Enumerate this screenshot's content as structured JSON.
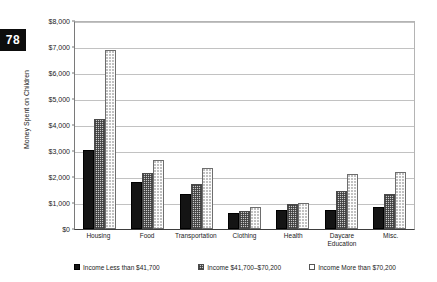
{
  "page_badge": {
    "number": "78"
  },
  "chart_data": {
    "type": "bar",
    "title": "",
    "xlabel": "",
    "ylabel": "Money Spent on Children",
    "ylim": [
      0,
      8000
    ],
    "ytick_labels": [
      "$8,000",
      "$7,000",
      "$6,000",
      "$5,000",
      "$4,000",
      "$3,000",
      "$2,000",
      "$1,000",
      "$0"
    ],
    "ytick_values": [
      8000,
      7000,
      6000,
      5000,
      4000,
      3000,
      2000,
      1000,
      0
    ],
    "grid": true,
    "legend_position": "bottom",
    "categories": [
      "Housing",
      "Food",
      "Transportation",
      "Clothing",
      "Health",
      "Daycare Education",
      "Misc."
    ],
    "category_label_lines": [
      [
        "Housing"
      ],
      [
        "Food"
      ],
      [
        "Transportation"
      ],
      [
        "Clothing"
      ],
      [
        "Health"
      ],
      [
        "Daycare",
        "Education"
      ],
      [
        "Misc."
      ]
    ],
    "series": [
      {
        "name": "Income Less than $41,700",
        "values": [
          3050,
          1800,
          1350,
          600,
          750,
          750,
          850
        ]
      },
      {
        "name": "Income $41,700–$70,200",
        "values": [
          4250,
          2150,
          1750,
          700,
          950,
          1450,
          1350
        ]
      },
      {
        "name": "Income More than $70,200",
        "values": [
          6880,
          2650,
          2350,
          850,
          1000,
          2100,
          2200
        ]
      }
    ]
  },
  "legend": {
    "items": [
      {
        "label": "Income Less than $41,700"
      },
      {
        "label": "Income $41,700–$70,200"
      },
      {
        "label": "Income More than $70,200"
      }
    ]
  },
  "colors": {
    "series_low": "#141414",
    "series_mid": "#c9c9c9",
    "series_high": "#ffffff",
    "grid": "#c2c2c2",
    "axis": "#3d3d3d",
    "text": "#1a1a1a",
    "badge_bg": "#0d0d0d",
    "badge_text": "#ffffff"
  }
}
